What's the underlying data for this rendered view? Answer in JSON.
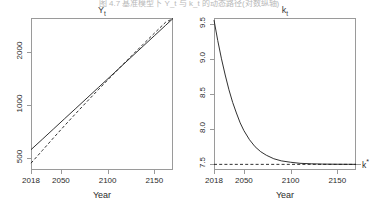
{
  "figure": {
    "caption": "图 4.7  基准模型下 Y_t 与 k_t 的动态路径(对数纵轴)",
    "background": "#ffffff",
    "line_color": "#1a1a1a",
    "axis_color": "#9a9a9a"
  },
  "chart_data": [
    {
      "type": "line",
      "id": "panel-Y",
      "title": "Y",
      "title_sub": "t",
      "xlabel": "Year",
      "ylabel": "",
      "xlim": [
        2018,
        2170
      ],
      "ylim": [
        430,
        3100
      ],
      "yscale": "log",
      "grid": false,
      "legend": false,
      "xticks": [
        2018,
        2050,
        2100,
        2150
      ],
      "xtick_labels": [
        "2018",
        "2050",
        "2100",
        "2150"
      ],
      "yticks": [
        500,
        1000,
        2000
      ],
      "ytick_labels": [
        "500",
        "1000",
        "2000"
      ],
      "series": [
        {
          "name": "Y_t actual",
          "style": "solid",
          "x": [
            2018,
            2030,
            2042,
            2054,
            2066,
            2078,
            2090,
            2102,
            2114,
            2126,
            2138,
            2150,
            2162,
            2170
          ],
          "y": [
            560,
            640,
            732,
            838,
            958,
            1096,
            1254,
            1435,
            1642,
            1879,
            2150,
            2460,
            2815,
            3080
          ]
        },
        {
          "name": "Y_t balanced growth path",
          "style": "dashed",
          "x": [
            2018,
            2030,
            2042,
            2054,
            2066,
            2078,
            2090,
            2102,
            2114,
            2126,
            2138,
            2150,
            2162,
            2170
          ],
          "y": [
            470,
            553,
            652,
            766,
            897,
            1047,
            1220,
            1418,
            1645,
            1905,
            2203,
            2543,
            2930,
            3080
          ]
        }
      ]
    },
    {
      "type": "line",
      "id": "panel-k",
      "title": "k",
      "title_sub": "t",
      "xlabel": "Year",
      "ylabel": "",
      "xlim": [
        2018,
        2170
      ],
      "ylim": [
        7.42,
        9.58
      ],
      "yscale": "linear",
      "grid": false,
      "legend": false,
      "xticks": [
        2018,
        2050,
        2100,
        2150
      ],
      "xtick_labels": [
        "2018",
        "2050",
        "2100",
        "2150"
      ],
      "yticks": [
        7.5,
        8.0,
        8.5,
        9.0,
        9.5
      ],
      "ytick_labels": [
        "7.5",
        "8.0",
        "8.5",
        "9.0",
        "9.5"
      ],
      "annotations": [
        {
          "name": "k-star",
          "text": "k",
          "sup": "*",
          "value": 7.5
        }
      ],
      "series": [
        {
          "name": "k_t transition path",
          "style": "solid",
          "x": [
            2018,
            2022,
            2026,
            2030,
            2034,
            2038,
            2042,
            2046,
            2050,
            2056,
            2062,
            2068,
            2074,
            2082,
            2090,
            2100,
            2110,
            2122,
            2134,
            2148,
            2162,
            2170
          ],
          "y": [
            9.55,
            9.26,
            9.0,
            8.77,
            8.56,
            8.38,
            8.23,
            8.09,
            7.98,
            7.85,
            7.75,
            7.68,
            7.63,
            7.58,
            7.55,
            7.53,
            7.515,
            7.508,
            7.504,
            7.502,
            7.501,
            7.5
          ]
        },
        {
          "name": "k* steady state",
          "style": "dashed",
          "x": [
            2018,
            2170
          ],
          "y": [
            7.5,
            7.5
          ]
        }
      ]
    }
  ]
}
